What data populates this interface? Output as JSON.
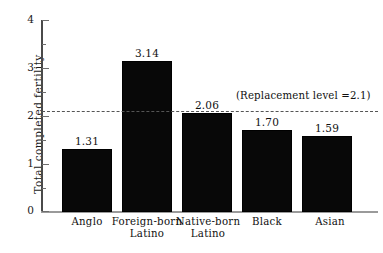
{
  "chart_data": {
    "type": "bar",
    "title": "",
    "xlabel": "",
    "ylabel": "Total completed fertility",
    "ylim": [
      0,
      4
    ],
    "grid": false,
    "legend": "none",
    "categories": [
      "Anglo",
      "Foreign-born Latino",
      "Native-born Latino",
      "Black",
      "Asian"
    ],
    "category_lines": [
      [
        "Anglo",
        ""
      ],
      [
        "Foreign-born",
        "Latino"
      ],
      [
        "Native-born",
        "Latino"
      ],
      [
        "Black",
        ""
      ],
      [
        "Asian",
        ""
      ]
    ],
    "values": [
      1.31,
      3.14,
      2.06,
      1.7,
      1.59
    ],
    "value_labels": [
      "1.31",
      "3.14",
      "2.06",
      "1.70",
      "1.59"
    ],
    "y_ticks_major": [
      0,
      1,
      2,
      3,
      4
    ],
    "y_tick_labels": [
      "0",
      "1",
      "2",
      "3",
      "4"
    ],
    "y_ticks_minor": [
      0.5,
      1.5,
      2.5,
      3.5
    ],
    "annotations": [
      {
        "name": "replacement-level",
        "text": "(Replacement level =2.1)",
        "value": 2.1,
        "style": "dashed-horizontal-line"
      }
    ],
    "colors": {
      "bar": "#080808",
      "axis": "#4a4a4a",
      "reference_line": "#555555",
      "text": "#111111",
      "background": "#ffffff"
    }
  }
}
